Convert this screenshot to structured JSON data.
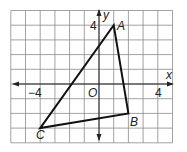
{
  "grid": {
    "x_min": -6,
    "x_max": 5,
    "y_min": -4,
    "y_max": 5,
    "origin_px": [
      99,
      84
    ],
    "unit_px": 14.7
  },
  "axes": {
    "x_label": "x",
    "y_label": "y",
    "origin_label": "O",
    "tick_labels": [
      {
        "axis": "x",
        "value": -4,
        "text": "−4"
      },
      {
        "axis": "x",
        "value": 4,
        "text": "4"
      },
      {
        "axis": "y",
        "value": 4,
        "text": "4"
      }
    ]
  },
  "triangle": {
    "vertices": [
      {
        "name": "A",
        "x": 1,
        "y": 4
      },
      {
        "name": "B",
        "x": 2,
        "y": -2
      },
      {
        "name": "C",
        "x": -4,
        "y": -3
      }
    ]
  },
  "labels": {
    "A": "A",
    "B": "B",
    "C": "C",
    "x_axis": "x",
    "y_axis": "y",
    "origin": "O",
    "x_neg4": "−4",
    "x_pos4": "4",
    "y_pos4": "4"
  }
}
